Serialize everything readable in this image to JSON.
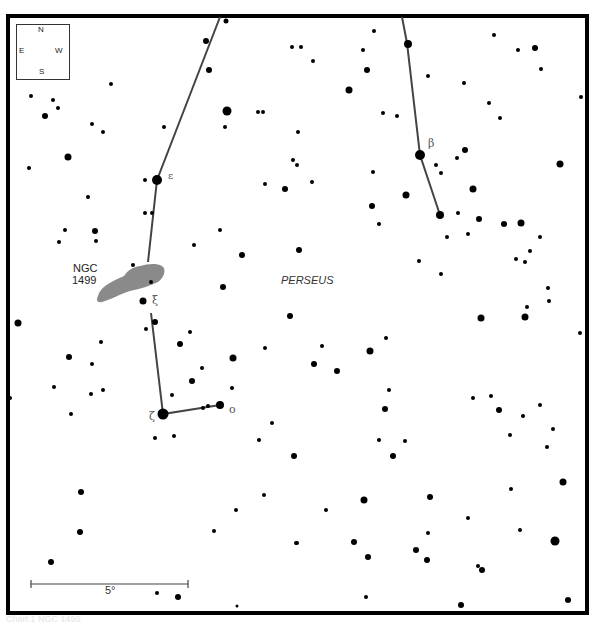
{
  "map": {
    "constellation_label": "PERSEUS",
    "nebula": {
      "name_line1": "NGC",
      "name_line2": "1499",
      "color": "#8a8a8a"
    },
    "compass": {
      "north": "N",
      "south": "S",
      "east": "E",
      "west": "W"
    },
    "scale_bar": {
      "label": "5°"
    },
    "star_labels": {
      "epsilon": "ε",
      "xi": "ξ",
      "zeta": "ζ",
      "omicron": "ο",
      "beta": "β"
    },
    "line_color": "#444444",
    "star_color": "#000000"
  },
  "caption": "Chart 1  NGC 1499"
}
